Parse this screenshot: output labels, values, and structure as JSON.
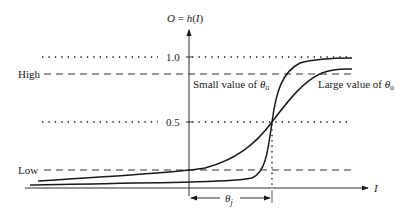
{
  "diagram": {
    "y_axis_label": "O = h(I)",
    "x_axis_label": "I",
    "levels": [
      {
        "name": "one",
        "label": "1.0",
        "style": "dotted"
      },
      {
        "name": "high",
        "label": "High",
        "style": "dashed"
      },
      {
        "name": "half",
        "label": "0.5",
        "style": "dotted"
      },
      {
        "name": "low",
        "label": "Low",
        "style": "dashed"
      }
    ],
    "curves": [
      {
        "name": "small-theta",
        "label": "Small value of θo"
      },
      {
        "name": "large-theta",
        "label": "Large value of θo"
      }
    ],
    "threshold_label": "θj",
    "colors": {
      "line": "#1a1a1a",
      "text": "#222222",
      "background": "#ffffff"
    }
  }
}
